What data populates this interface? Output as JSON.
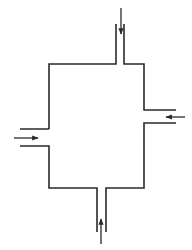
{
  "diagram": {
    "type": "flow-chamber",
    "colors": {
      "background": "#ffffff",
      "stroke": "#2a2a2a"
    },
    "chamber": {
      "x1": 49,
      "y1": 64,
      "x2": 144,
      "y2": 188
    },
    "ports": [
      {
        "id": "top",
        "wall_a": 116,
        "wall_b": 124,
        "extent": 24,
        "arrow": {
          "from": [
            121,
            8
          ],
          "to": [
            121,
            34
          ],
          "direction": "down"
        }
      },
      {
        "id": "right",
        "wall_a": 110,
        "wall_b": 123,
        "extent": 176,
        "arrow": {
          "from": [
            185,
            117
          ],
          "to": [
            166,
            117
          ],
          "direction": "left"
        }
      },
      {
        "id": "left",
        "wall_a": 129,
        "wall_b": 146,
        "extent": 20,
        "arrow": {
          "from": [
            14,
            138
          ],
          "to": [
            38,
            138
          ],
          "direction": "right"
        }
      },
      {
        "id": "bottom",
        "wall_a": 97,
        "wall_b": 106,
        "extent": 232,
        "arrow": {
          "from": [
            101,
            244
          ],
          "to": [
            101,
            219
          ],
          "direction": "up"
        }
      }
    ]
  }
}
